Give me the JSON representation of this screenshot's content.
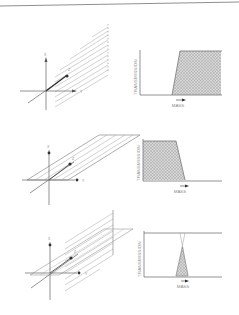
{
  "figure": {
    "panels": [
      {
        "id": "panel-1",
        "diagram": {
          "axes": [
            "X",
            "Y",
            "Z"
          ],
          "plane": "vertical-xz-slanted"
        },
        "plot": {
          "ylabel": "TRANSMISSION",
          "xlabel": "MASS",
          "shape": "high-pass",
          "description": "Transmission zero at low mass, rises steeply to full at high mass"
        }
      },
      {
        "id": "panel-2",
        "diagram": {
          "axes": [
            "X",
            "Y",
            "Z"
          ],
          "plane": "horizontal-xy-slanted"
        },
        "plot": {
          "ylabel": "TRANSMISSION",
          "xlabel": "MASS",
          "shape": "low-pass",
          "description": "Transmission full at low mass, drops to zero at high mass"
        }
      },
      {
        "id": "panel-3",
        "diagram": {
          "axes": [
            "X",
            "Y",
            "Z"
          ],
          "plane": "combined-vertical-and-horizontal"
        },
        "plot": {
          "ylabel": "TRANSMISSION",
          "xlabel": "MASS",
          "shape": "band-pass",
          "description": "Narrow triangular transmission peak where high-pass and low-pass overlap"
        }
      }
    ],
    "colors": {
      "line": "#7a7a7a",
      "hatch": "#b0b0b0",
      "fill": "#c4c4c4",
      "text": "#8a8a8a",
      "dot": "#333333"
    }
  }
}
